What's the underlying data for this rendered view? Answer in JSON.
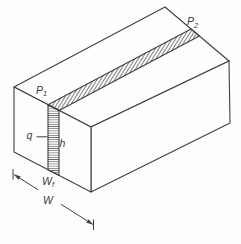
{
  "diagram": {
    "type": "isometric-block-with-hatched-strip",
    "labels": {
      "p1": {
        "base": "P",
        "sub": "1"
      },
      "p2": {
        "base": "P",
        "sub": "2"
      },
      "q": "q",
      "h": "h",
      "wf": {
        "base": "W",
        "sub": "f"
      },
      "w": "W"
    },
    "colors": {
      "line": "#3f3f3f",
      "hatch": "#4a4a4a",
      "text": "#3a3a3a",
      "background": "#fdfdfd"
    }
  }
}
